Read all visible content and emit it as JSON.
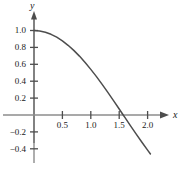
{
  "chart_data": {
    "type": "line",
    "title": "",
    "subtitle": "",
    "xlabel": "x",
    "ylabel": "y",
    "function": "y = cos(x)",
    "xlim": [
      -0.18,
      2.25
    ],
    "ylim": [
      -0.58,
      1.18
    ],
    "grid": false,
    "legend": null,
    "xticks": [
      0.5,
      1.0,
      1.5,
      2.0
    ],
    "xtick_labels": [
      "0.5",
      "1.0",
      "1.5",
      "2.0"
    ],
    "yticks": [
      -0.4,
      -0.2,
      0.2,
      0.4,
      0.6,
      0.8,
      1.0
    ],
    "ytick_labels": [
      "−0.4",
      "−0.2",
      "0.2",
      "0.4",
      "0.6",
      "0.8",
      "1.0"
    ],
    "series": [
      {
        "name": "cos(x)",
        "color": "#4d4d4d",
        "x": [
          0.0,
          0.1,
          0.2,
          0.3,
          0.4,
          0.5,
          0.6,
          0.7,
          0.8,
          0.9,
          1.0,
          1.1,
          1.2,
          1.3,
          1.4,
          1.5,
          1.5708,
          1.6,
          1.7,
          1.8,
          1.9,
          2.0,
          2.05
        ],
        "values": [
          1.0,
          0.995,
          0.98,
          0.955,
          0.921,
          0.878,
          0.825,
          0.765,
          0.697,
          0.622,
          0.54,
          0.454,
          0.362,
          0.267,
          0.17,
          0.071,
          0.0,
          -0.029,
          -0.129,
          -0.227,
          -0.323,
          -0.416,
          -0.461
        ]
      }
    ],
    "x_zero_crossing": 1.5708,
    "axes_color": "#8c8c8c",
    "tick_color": "#4d4d4d",
    "text_color": "#1a1a1a",
    "background": "#ffffff"
  },
  "labels": {
    "x_axis_name": "x",
    "y_axis_name": "y"
  }
}
